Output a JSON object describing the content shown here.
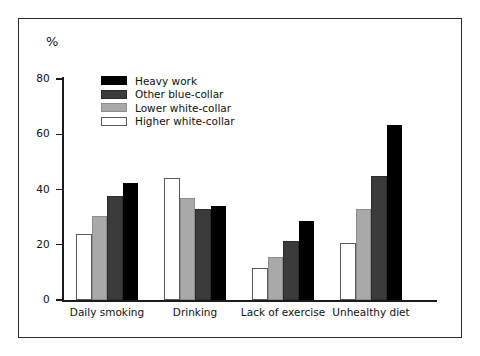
{
  "chart_data": {
    "type": "bar",
    "title": "",
    "subtitle": "",
    "xlabel": "",
    "ylabel": "%",
    "ylim": [
      0,
      80
    ],
    "y_ticks": [
      0,
      20,
      40,
      60,
      80
    ],
    "y_tick_labels": [
      "0",
      "20",
      "40",
      "60",
      "80"
    ],
    "grid": false,
    "legend_position": "top-left-inside",
    "categories": [
      "Daily smoking",
      "Drinking",
      "Lack of exercise",
      "Unhealthy diet"
    ],
    "series": [
      {
        "name": "Higher white-collar",
        "color": "#ffffff",
        "swatch": "white",
        "values": [
          24,
          44,
          11.5,
          20.5
        ]
      },
      {
        "name": "Lower white-collar",
        "color": "#a9a9a9",
        "swatch": "mid",
        "values": [
          30.5,
          37,
          15.5,
          33
        ]
      },
      {
        "name": "Other blue-collar",
        "color": "#3b3b3b",
        "swatch": "dark",
        "values": [
          37.5,
          33,
          21.5,
          45
        ]
      },
      {
        "name": "Heavy work",
        "color": "#000000",
        "swatch": "black",
        "values": [
          42.5,
          34,
          28.5,
          63.5
        ]
      }
    ],
    "legend_order": [
      "Heavy work",
      "Other blue-collar",
      "Lower white-collar",
      "Higher white-collar"
    ]
  },
  "legend": {
    "items": [
      {
        "label": "Heavy work",
        "swatch": "black"
      },
      {
        "label": "Other blue-collar",
        "swatch": "dark"
      },
      {
        "label": "Lower white-collar",
        "swatch": "mid"
      },
      {
        "label": "Higher white-collar",
        "swatch": "white"
      }
    ]
  },
  "colors": {
    "frame": "#2a2a2a",
    "axis": "#1a1a1a",
    "text": "#111111",
    "heavy_work": "#000000",
    "other_blue_collar": "#3b3b3b",
    "lower_white_collar": "#a9a9a9",
    "higher_white_collar": "#ffffff"
  }
}
